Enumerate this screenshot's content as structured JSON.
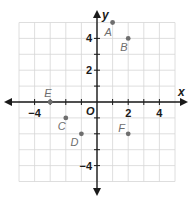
{
  "chart_data": {
    "type": "scatter",
    "title": "",
    "xlabel": "x",
    "ylabel": "y",
    "origin_label": "O",
    "xlim": [
      -5,
      5
    ],
    "ylim": [
      -5,
      5
    ],
    "grid": true,
    "x_tick_labels": [
      {
        "value": -4,
        "label": "−4"
      },
      {
        "value": 2,
        "label": "2"
      },
      {
        "value": 4,
        "label": "4"
      }
    ],
    "y_tick_labels": [
      {
        "value": 4,
        "label": "4"
      },
      {
        "value": 2,
        "label": "2"
      },
      {
        "value": -4,
        "label": "−4"
      }
    ],
    "points": [
      {
        "label": "A",
        "x": 1,
        "y": 5
      },
      {
        "label": "B",
        "x": 2,
        "y": 4
      },
      {
        "label": "C",
        "x": -2,
        "y": -1
      },
      {
        "label": "D",
        "x": -1,
        "y": -2
      },
      {
        "label": "E",
        "x": -3,
        "y": 0
      },
      {
        "label": "F",
        "x": 2,
        "y": -2
      }
    ],
    "point_color": "#6e6e6e",
    "axis_color": "#1a1a1a",
    "grid_color": "#d6d6d6"
  }
}
